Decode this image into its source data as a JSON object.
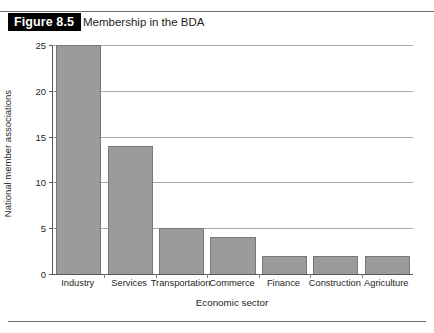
{
  "figure": {
    "number_label": "Figure 8.5",
    "caption": "Membership in the BDA"
  },
  "chart_data": {
    "type": "bar",
    "title": "Membership in the BDA",
    "xlabel": "Economic sector",
    "ylabel": "National member associations",
    "categories": [
      "Industry",
      "Services",
      "Transportation",
      "Commerce",
      "Finance",
      "Construction",
      "Agriculture"
    ],
    "values": [
      25,
      14,
      5,
      4,
      2,
      2,
      2
    ],
    "ylim": [
      0,
      25
    ],
    "yticks": [
      0,
      5,
      10,
      15,
      20,
      25
    ],
    "ytick_labels": [
      "0",
      "5",
      "10",
      "15",
      "20",
      "25"
    ],
    "grid": "horizontal",
    "legend": "none",
    "bar_color": "#9b9b9b",
    "bar_border_color": "#77787b",
    "axis_color": "#58595b",
    "gridline_color": "#a7a9ac"
  }
}
